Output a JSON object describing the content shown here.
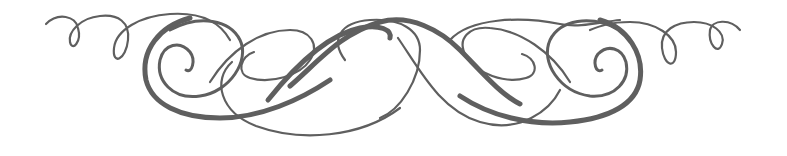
{
  "image": {
    "description": "Symmetrical calligraphic flourish ornament",
    "stroke_color": "#5f5f5f",
    "background_color": "#ffffff"
  }
}
